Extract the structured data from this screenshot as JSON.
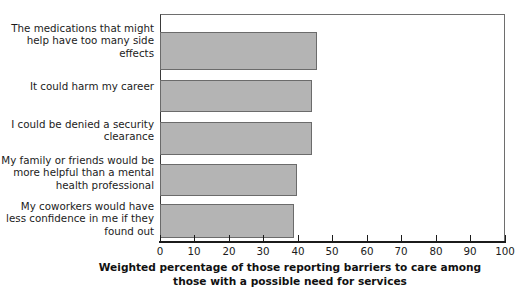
{
  "chart_data": {
    "type": "bar",
    "orientation": "horizontal",
    "title": "",
    "xlabel": "Weighted percentage of those reporting barriers to care among those with a possible need for services",
    "ylabel": "",
    "xlim": [
      0,
      100
    ],
    "xticks": [
      0,
      10,
      20,
      30,
      40,
      50,
      60,
      70,
      80,
      90,
      100
    ],
    "xtick_labels": [
      "0",
      "10",
      "20",
      "30",
      "40",
      "50",
      "60",
      "70",
      "80",
      "90",
      "100"
    ],
    "grid": false,
    "legend": false,
    "bar_color": "#b4b4b4",
    "bar_edge_color": "#6b6b6b",
    "categories": [
      "The medications that might help have too many side effects",
      "It could harm my career",
      "I could be denied a security clearance",
      "My family or friends would be more helpful than a mental health professional",
      "My coworkers would have less confidence in me if they found out"
    ],
    "category_lines": [
      [
        "The medications that might",
        "help have too many side",
        "effects"
      ],
      [
        "It could harm my career"
      ],
      [
        "I could be denied a security",
        "clearance"
      ],
      [
        "My family or friends would be",
        "more helpful than a mental",
        "health professional"
      ],
      [
        "My coworkers would have less",
        "confidence in me if they",
        "found out"
      ]
    ],
    "values": [
      45.6,
      44.0,
      44.0,
      39.8,
      38.8
    ]
  },
  "axis_title_lines": [
    "Weighted percentage of those reporting barriers to care among",
    "those with a possible need for services"
  ]
}
